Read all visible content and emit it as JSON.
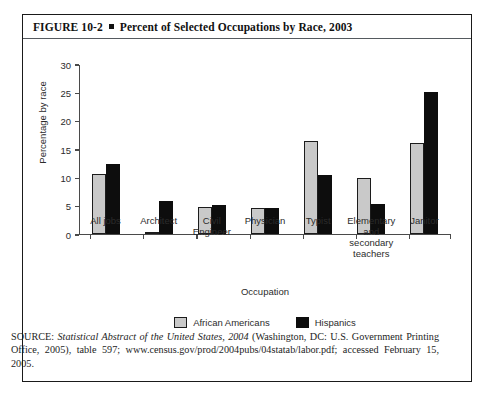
{
  "figure": {
    "label": "FIGURE 10-2",
    "title": "Percent of Selected Occupations by Race, 2003"
  },
  "source_note": {
    "prefix": "SOURCE: ",
    "italic_title": "Statistical Abstract of the United States, 2004",
    "rest": " (Washington, DC: U.S. Government Printing Office, 2005), table 597; www.census.gov/prod/2004pubs/04statab/labor.pdf; accessed February 15, 2005."
  },
  "colors": {
    "african_americans": "#c9c9c9",
    "hispanics": "#0d0d0d",
    "axis": "#4a4a4a",
    "border": "#1a1a1a"
  },
  "chart_data": {
    "type": "bar",
    "title": "Percent of Selected Occupations by Race, 2003",
    "xlabel": "Occupation",
    "ylabel": "Percentage by race",
    "ylim": [
      0,
      30
    ],
    "yticks": [
      0,
      5,
      10,
      15,
      20,
      25,
      30
    ],
    "ytick_labels": [
      "0",
      "5",
      "10",
      "15",
      "20",
      "25",
      "30"
    ],
    "grid": false,
    "legend_position": "bottom",
    "categories": [
      "All jobs",
      "Architect",
      "Civil Engineer",
      "Physician",
      "Typist",
      "Elementary and secondary teachers",
      "Janitor"
    ],
    "category_lines": [
      [
        "All jobs"
      ],
      [
        "Architect"
      ],
      [
        "Civil",
        "Engineer"
      ],
      [
        "Physician"
      ],
      [
        "Typist"
      ],
      [
        "Elementary",
        "and",
        "secondary",
        "teachers"
      ],
      [
        "Janitor"
      ]
    ],
    "series": [
      {
        "name": "African Americans",
        "color": "#c9c9c9",
        "values": [
          10.5,
          0.3,
          4.7,
          4.6,
          16.3,
          9.8,
          16.1
        ]
      },
      {
        "name": "Hispanics",
        "color": "#0d0d0d",
        "values": [
          12.3,
          5.8,
          5.0,
          4.5,
          10.4,
          5.3,
          25.0
        ]
      }
    ]
  }
}
